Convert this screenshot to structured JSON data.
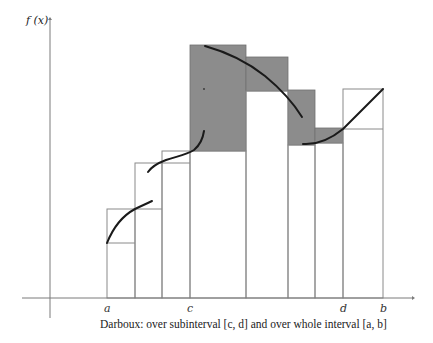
{
  "diagram": {
    "caption": "Darboux: over subinterval [c, d] and over whole interval [a, b]",
    "y_axis_label": "f (x)",
    "x_tick_labels": [
      {
        "name": "a",
        "partition_index": 0
      },
      {
        "name": "c",
        "partition_index": 3
      },
      {
        "name": "d",
        "partition_index": 7
      },
      {
        "name": "b",
        "partition_index": 8
      }
    ],
    "partition_count": 8,
    "subinterval": [
      "c",
      "d"
    ],
    "whole_interval": [
      "a",
      "b"
    ],
    "colors": {
      "shaded": "#8c8c8c",
      "outline": "#8a8a8a",
      "curve": "#1a1a1a",
      "axis": "#7a7a7a"
    },
    "legend_note": "Shaded rectangles show upper minus lower Darboux sums over [c, d]; outlined rectangles show lower/upper sums over [a, b]"
  }
}
